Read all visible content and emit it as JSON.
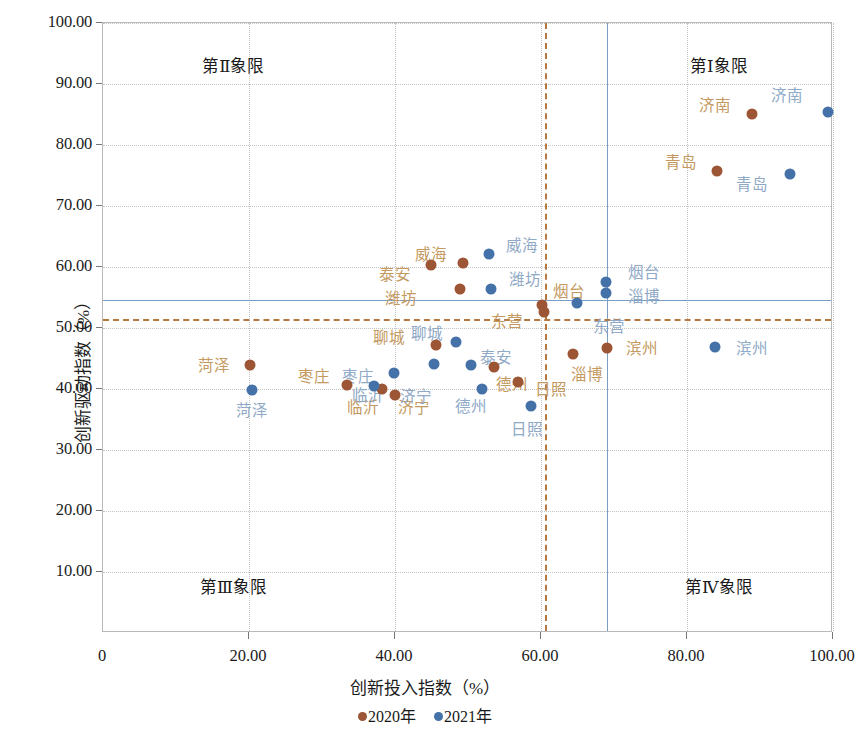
{
  "chart_data": {
    "type": "scatter",
    "title": "",
    "xlabel": "创新投入指数（%）",
    "ylabel": "创新驱动指数（%）",
    "xlim": [
      0,
      100
    ],
    "ylim": [
      0,
      100
    ],
    "xticks": [
      "0",
      "20.00",
      "40.00",
      "60.00",
      "80.00",
      "100.00"
    ],
    "xtick_values": [
      0,
      20,
      40,
      60,
      80,
      100
    ],
    "yticks": [
      "10.00",
      "20.00",
      "30.00",
      "40.00",
      "50.00",
      "60.00",
      "70.00",
      "80.00",
      "90.00",
      "100.00"
    ],
    "ytick_values": [
      10,
      20,
      30,
      40,
      50,
      60,
      70,
      80,
      90,
      100
    ],
    "grid": true,
    "legend_position": "bottom",
    "colors": {
      "y2020_point": "#9c5535",
      "y2021_point": "#4472a8",
      "y2020_label": "#c3995f",
      "y2021_label": "#8fa9c6",
      "ref_line_blue": "#7a9ec4",
      "ref_line_brown": "#b5793f",
      "gridline": "#c3c3c3",
      "frame": "#b9b9b9"
    },
    "reference_lines": [
      {
        "name": "mean-x-2020",
        "orient": "vertical",
        "value": 60.5,
        "style": "dashed",
        "color": "#b5793f"
      },
      {
        "name": "mean-x-2021",
        "orient": "vertical",
        "value": 69.0,
        "style": "solid",
        "color": "#7a9ec4"
      },
      {
        "name": "mean-y-2020",
        "orient": "horizontal",
        "value": 51.5,
        "style": "dashed",
        "color": "#b5793f"
      },
      {
        "name": "mean-y-2021",
        "orient": "horizontal",
        "value": 54.6,
        "style": "solid",
        "color": "#7a9ec4"
      }
    ],
    "quadrants": [
      {
        "name": "quadrant-2",
        "label": "第Ⅱ象限",
        "x": 18.0,
        "y": 93.0
      },
      {
        "name": "quadrant-1",
        "label": "第Ⅰ象限",
        "x": 84.5,
        "y": 93.0
      },
      {
        "name": "quadrant-3",
        "label": "第Ⅲ象限",
        "x": 18.0,
        "y": 7.5
      },
      {
        "name": "quadrant-4",
        "label": "第Ⅳ象限",
        "x": 84.5,
        "y": 7.5
      }
    ],
    "series": [
      {
        "name": "2020年",
        "color": "#9c5535",
        "points": [
          {
            "city": "济南",
            "x": 89.0,
            "y": 85.0,
            "lx": 84.0,
            "ly": 86.6
          },
          {
            "city": "青岛",
            "x": 84.3,
            "y": 75.6,
            "lx": 79.3,
            "ly": 77.2
          },
          {
            "city": "威海",
            "x": 49.5,
            "y": 60.5,
            "lx": 45.0,
            "ly": 62.2
          },
          {
            "city": "泰安",
            "x": 45.0,
            "y": 60.2,
            "lx": 40.2,
            "ly": 58.8
          },
          {
            "city": "潍坊",
            "x": 49.0,
            "y": 56.2,
            "lx": 41.0,
            "ly": 55.0
          },
          {
            "city": "烟台",
            "x": 60.3,
            "y": 53.6,
            "lx": 64.0,
            "ly": 56.0
          },
          {
            "city": "东营",
            "x": 60.5,
            "y": 52.5,
            "lx": 55.5,
            "ly": 51.2
          },
          {
            "city": "滨州",
            "x": 69.2,
            "y": 46.5,
            "lx": 74.0,
            "ly": 46.8
          },
          {
            "city": "淄博",
            "x": 64.5,
            "y": 45.5,
            "lx": 66.5,
            "ly": 42.4
          },
          {
            "city": "聊城",
            "x": 45.8,
            "y": 47.0,
            "lx": 39.3,
            "ly": 48.5
          },
          {
            "city": "菏泽",
            "x": 20.3,
            "y": 43.8,
            "lx": 15.3,
            "ly": 44.0
          },
          {
            "city": "德州",
            "x": 53.7,
            "y": 43.5,
            "lx": 56.2,
            "ly": 40.9
          },
          {
            "city": "日照",
            "x": 57.0,
            "y": 41.0,
            "lx": 61.5,
            "ly": 40.0
          },
          {
            "city": "枣庄",
            "x": 33.5,
            "y": 40.5,
            "lx": 29.0,
            "ly": 42.2
          },
          {
            "city": "临沂",
            "x": 38.3,
            "y": 39.9,
            "lx": 35.8,
            "ly": 37.1
          },
          {
            "city": "济宁",
            "x": 40.1,
            "y": 38.9,
            "lx": 42.8,
            "ly": 37.1
          }
        ]
      },
      {
        "name": "2021年",
        "color": "#4472a8",
        "points": [
          {
            "city": "济南",
            "x": 99.4,
            "y": 85.3,
            "lx": 93.8,
            "ly": 88.2
          },
          {
            "city": "青岛",
            "x": 94.3,
            "y": 75.1,
            "lx": 89.0,
            "ly": 73.6
          },
          {
            "city": "威海",
            "x": 53.0,
            "y": 62.0,
            "lx": 57.5,
            "ly": 63.6
          },
          {
            "city": "潍坊",
            "x": 53.3,
            "y": 56.3,
            "lx": 58.0,
            "ly": 58.0
          },
          {
            "city": "烟台",
            "x": 69.1,
            "y": 57.3,
            "lx": 74.2,
            "ly": 59.2
          },
          {
            "city": "淄博",
            "x": 69.1,
            "y": 55.5,
            "lx": 74.2,
            "ly": 55.2
          },
          {
            "city": "东营",
            "x": 65.0,
            "y": 54.0,
            "lx": 69.5,
            "ly": 50.3
          },
          {
            "city": "滨州",
            "x": 84.0,
            "y": 46.8,
            "lx": 89.0,
            "ly": 46.8
          },
          {
            "city": "聊城",
            "x": 48.5,
            "y": 47.5,
            "lx": 44.5,
            "ly": 49.2
          },
          {
            "city": "泰安",
            "x": 50.5,
            "y": 43.8,
            "lx": 54.0,
            "ly": 45.2
          },
          {
            "city": "济宁",
            "x": 45.5,
            "y": 44.0,
            "lx": 43.0,
            "ly": 38.9
          },
          {
            "city": "临沂",
            "x": 40.0,
            "y": 42.5,
            "lx": 36.5,
            "ly": 39.0
          },
          {
            "city": "菏泽",
            "x": 20.5,
            "y": 39.7,
            "lx": 20.5,
            "ly": 36.6
          },
          {
            "city": "德州",
            "x": 52.0,
            "y": 39.9,
            "lx": 50.5,
            "ly": 37.2
          },
          {
            "city": "日照",
            "x": 58.7,
            "y": 37.0,
            "lx": 58.2,
            "ly": 33.5
          },
          {
            "city": "枣庄",
            "x": 37.2,
            "y": 40.4,
            "lx": 35.0,
            "ly": 42.2
          }
        ]
      }
    ],
    "legend": [
      {
        "name": "legend-2020",
        "label": "2020年",
        "color": "#9c5535"
      },
      {
        "name": "legend-2021",
        "label": "2021年",
        "color": "#4472a8"
      }
    ]
  }
}
